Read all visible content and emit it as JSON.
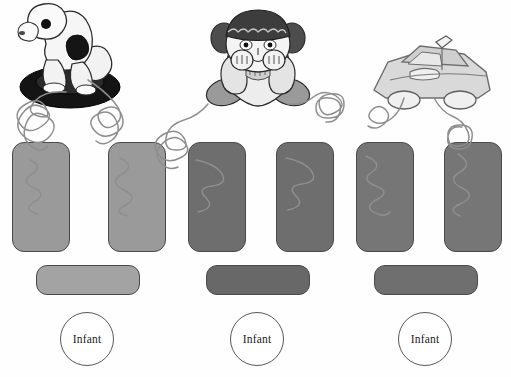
{
  "figure": {
    "type": "illustration",
    "background_color": "#fefefe",
    "line_color": "#4a4a4a",
    "wire_color": "#8a8a8a"
  },
  "groups": [
    {
      "id": "group-1",
      "toy": {
        "name": "rocking-horse-on-tire-toy",
        "label": "Toy horse on black tire",
        "body_color": "#efefef",
        "accent_color": "#1a1a1a"
      },
      "left_panel": {
        "name": "left-speaker-panel",
        "color": "#9a9a9a"
      },
      "right_panel": {
        "name": "right-speaker-panel",
        "color": "#9a9a9a"
      },
      "base_bar": {
        "name": "base-bar",
        "color": "#a3a3a3"
      },
      "badge": {
        "name": "infant-badge",
        "label": "Infant"
      }
    },
    {
      "id": "group-2",
      "toy": {
        "name": "teddy-bear-doll-toy",
        "label": "Toy bear doll with dark cap",
        "body_color": "#e9e9e9",
        "accent_color": "#555555"
      },
      "left_panel": {
        "name": "left-speaker-panel",
        "color": "#6e6e6e"
      },
      "right_panel": {
        "name": "right-speaker-panel",
        "color": "#6e6e6e"
      },
      "base_bar": {
        "name": "base-bar",
        "color": "#686868"
      },
      "badge": {
        "name": "infant-badge",
        "label": "Infant"
      }
    },
    {
      "id": "group-3",
      "toy": {
        "name": "toy-car",
        "label": "Toy car with roof light",
        "body_color": "#dedede",
        "accent_color": "#8c8c8c"
      },
      "left_panel": {
        "name": "left-speaker-panel",
        "color": "#767676"
      },
      "right_panel": {
        "name": "right-speaker-panel",
        "color": "#767676"
      },
      "base_bar": {
        "name": "base-bar",
        "color": "#6f6f6f"
      },
      "badge": {
        "name": "infant-badge",
        "label": "Infant"
      }
    }
  ]
}
